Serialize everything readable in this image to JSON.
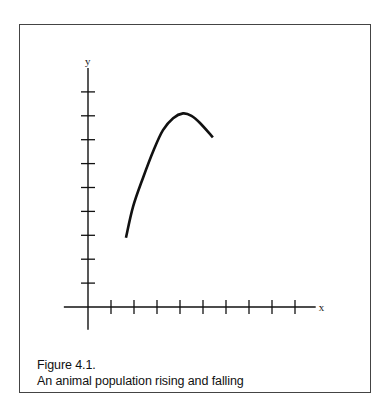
{
  "figure": {
    "number_label": "Figure 4.1.",
    "caption": "An animal population rising and falling"
  },
  "chart_data": {
    "type": "line",
    "title": "An animal population rising and falling",
    "xlabel": "x",
    "ylabel": "y",
    "xlim": [
      -1,
      10
    ],
    "ylim": [
      -1,
      10
    ],
    "x_ticks": [
      1,
      2,
      3,
      4,
      5,
      6,
      7,
      8,
      9
    ],
    "y_ticks": [
      1,
      2,
      3,
      4,
      5,
      6,
      7,
      8,
      9
    ],
    "tick_labels_shown": false,
    "grid": false,
    "legend": "none",
    "series": [
      {
        "name": "population",
        "color": "#111111",
        "x": [
          1.65,
          1.96,
          2.39,
          2.87,
          3.26,
          3.7,
          4.13,
          4.5,
          4.87,
          5.43
        ],
        "y": [
          2.9,
          4.2,
          5.4,
          6.6,
          7.4,
          7.9,
          8.1,
          8.0,
          7.7,
          7.1
        ]
      }
    ]
  }
}
